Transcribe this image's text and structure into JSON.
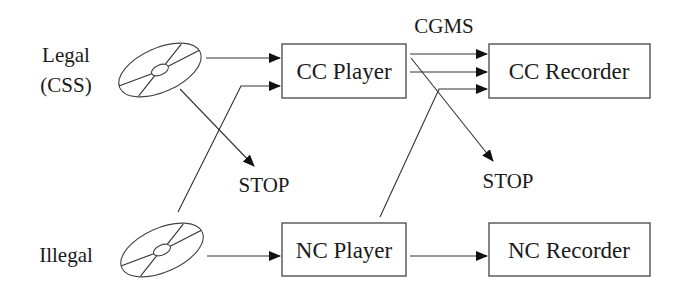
{
  "diagram": {
    "sources": [
      {
        "id": "legal",
        "label_line1": "Legal",
        "label_line2": "(CSS)",
        "icon": "disc-icon"
      },
      {
        "id": "illegal",
        "label_line1": "Illegal",
        "icon": "disc-icon"
      }
    ],
    "nodes": {
      "cc_player": {
        "label": "CC Player"
      },
      "cc_recorder": {
        "label": "CC Recorder"
      },
      "nc_player": {
        "label": "NC Player"
      },
      "nc_recorder": {
        "label": "NC Recorder"
      }
    },
    "annotations": {
      "cgms": "CGMS",
      "stop_1": "STOP",
      "stop_2": "STOP"
    },
    "edges": [
      {
        "from": "legal",
        "to": "cc_player"
      },
      {
        "from": "legal",
        "to": "stop_1"
      },
      {
        "from": "illegal",
        "to": "cc_player"
      },
      {
        "from": "illegal",
        "to": "nc_player"
      },
      {
        "from": "cc_player",
        "to": "cc_recorder",
        "label": "CGMS"
      },
      {
        "from": "cc_player",
        "to": "cc_recorder"
      },
      {
        "from": "cc_player",
        "to": "stop_2"
      },
      {
        "from": "nc_player",
        "to": "cc_recorder"
      },
      {
        "from": "nc_player",
        "to": "nc_recorder"
      }
    ],
    "colors": {
      "stroke": "#333333",
      "text": "#1a1a1a",
      "background": "#ffffff"
    }
  }
}
